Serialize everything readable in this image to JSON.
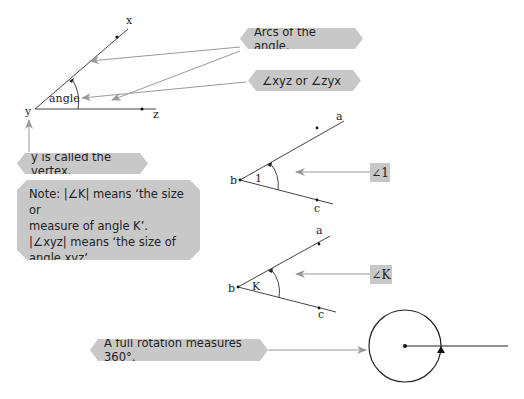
{
  "diagram1": {
    "labels": {
      "x": "x",
      "y": "y",
      "z": "z",
      "angle": "angle"
    },
    "callouts": {
      "arcs": "Arcs of the angle.",
      "names": "∠xyz or ∠zyx",
      "vertex": "y is called the vertex."
    }
  },
  "note": {
    "lines": [
      "Note: |∠K| means ‘the size or",
      "measure of angle K’.",
      "|∠xyz| means ‘the size of",
      "angle xyz’."
    ]
  },
  "diagram2": {
    "labels": {
      "a": "a",
      "b": "b",
      "c": "c",
      "angle": "1"
    },
    "tag": "∠1"
  },
  "diagram3": {
    "labels": {
      "a": "a",
      "b": "b",
      "c": "c",
      "angle": "K"
    },
    "tag": "∠K"
  },
  "rotation": {
    "callout": "A full rotation measures 360°."
  },
  "colors": {
    "callout_bg": "#c8c8c8",
    "arrow": "#999999",
    "line": "#333333"
  }
}
